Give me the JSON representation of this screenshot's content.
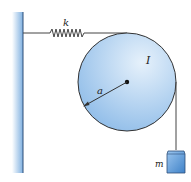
{
  "diagram": {
    "type": "physics-spring-pulley-mass",
    "labels": {
      "spring_constant": "k",
      "moment_of_inertia": "I",
      "radius": "a",
      "mass": "m"
    },
    "colors": {
      "wall": "#7fb0e0",
      "wall_edge": "#3a6fa8",
      "disk_fill_light": "#d8e9f8",
      "disk_fill_dark": "#8dbbe8",
      "block_fill": "#5b9ad8",
      "line": "#333333"
    }
  }
}
